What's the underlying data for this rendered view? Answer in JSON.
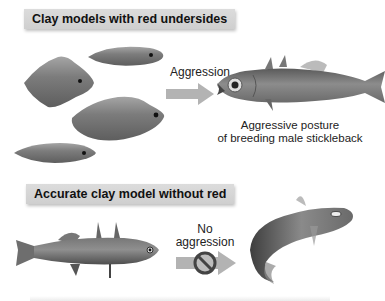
{
  "panels": {
    "top": {
      "header": "Clay models with red undersides",
      "arrow_label": "Aggression",
      "fish_caption_line1": "Aggressive posture",
      "fish_caption_line2": "of breeding male stickleback"
    },
    "bottom": {
      "header": "Accurate clay model without red",
      "arrow_label_line1": "No",
      "arrow_label_line2": "aggression"
    }
  },
  "icons": {
    "arrow": "arrow-right-icon",
    "prohibited": "no-symbol-icon"
  },
  "colors": {
    "label_bar": "#d4d4d4",
    "arrow": "#b3b3b3",
    "model": "#7a7a7a",
    "text": "#222222"
  }
}
